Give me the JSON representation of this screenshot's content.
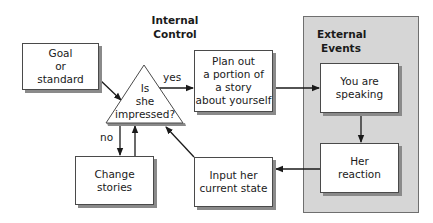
{
  "diagram": {
    "type": "flowchart",
    "headings": {
      "internal_control": [
        "Internal",
        "Control"
      ],
      "external_events": [
        "External",
        "Events"
      ]
    },
    "nodes": {
      "goal": [
        "Goal",
        "or",
        "standard"
      ],
      "decision": [
        "Is",
        "she",
        "impressed?"
      ],
      "plan": [
        "Plan out",
        "a portion of",
        "a story",
        "about yourself"
      ],
      "speaking": [
        "You are",
        "speaking"
      ],
      "reaction": [
        "Her",
        "reaction"
      ],
      "input": [
        "Input her",
        "current state"
      ],
      "change": [
        "Change",
        "stories"
      ]
    },
    "edge_labels": {
      "yes": "yes",
      "no": "no"
    },
    "colors": {
      "panel_fill": "#d6d6d6",
      "box_fill": "#ffffff",
      "line": "#1a1a1a",
      "shadow": "#8a8a8a"
    }
  }
}
